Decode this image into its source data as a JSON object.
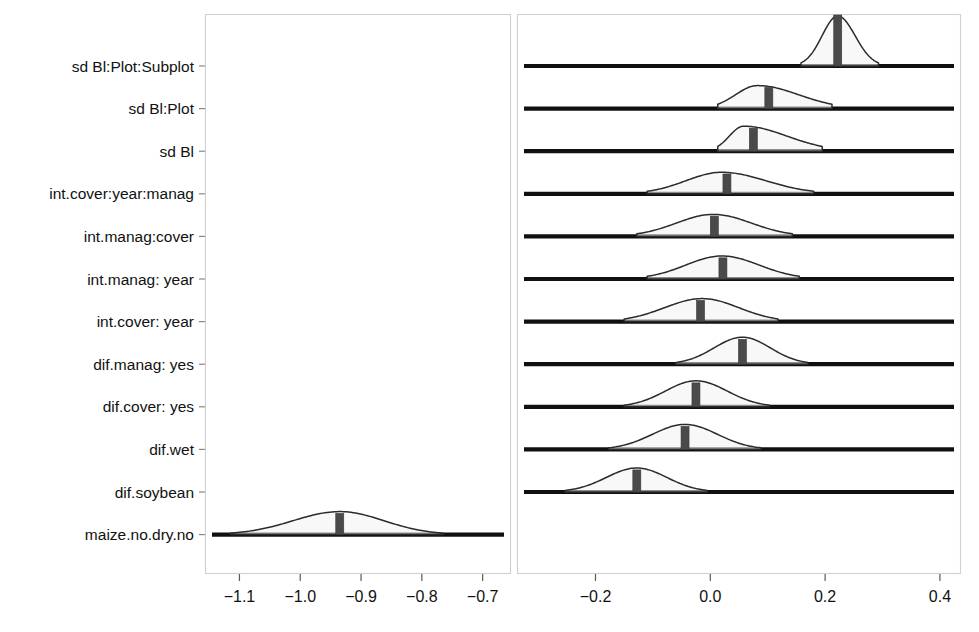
{
  "figure": {
    "name": "posterior-density-ridgeline-plot"
  },
  "chart_data": {
    "type": "area",
    "title": "",
    "xlabel": "",
    "ylabel": "",
    "grid": false,
    "legend": null,
    "orientation": "horizontal-ridgeline",
    "broken_axis": true,
    "axis_segments": [
      {
        "name": "left-panel",
        "xlim": [
          -1.155,
          -0.655
        ],
        "ticks": [
          -1.1,
          -1.0,
          -0.9,
          -0.8,
          -0.7
        ],
        "tick_labels": [
          "−1.1",
          "−1.0",
          "−0.9",
          "−0.8",
          "−0.7"
        ]
      },
      {
        "name": "right-panel",
        "xlim": [
          -0.335,
          0.435
        ],
        "ticks": [
          -0.2,
          0.0,
          0.2,
          0.4
        ],
        "tick_labels": [
          "−0.2",
          "0.0",
          "0.2",
          "0.4"
        ]
      }
    ],
    "categories": [
      "sd Bl:Plot:Subplot",
      "sd Bl:Plot",
      "sd Bl",
      "int.cover:year:manag",
      "int.manag:cover",
      "int.manag: year",
      "int.cover: year",
      "dif.manag: yes",
      "dif.cover: yes",
      "dif.wet",
      "dif.soybean",
      "maize.no.dry.no"
    ],
    "series": [
      {
        "name": "sd Bl:Plot:Subplot",
        "panel": "right",
        "median": 0.222,
        "mode": 0.222,
        "lower": 0.158,
        "upper": 0.293,
        "peak_height": 1.0,
        "shape": "symmetric-narrow"
      },
      {
        "name": "sd Bl:Plot",
        "panel": "right",
        "median": 0.102,
        "mode": 0.082,
        "lower": 0.013,
        "upper": 0.212,
        "peak_height": 0.46,
        "shape": "right-skewed-flat"
      },
      {
        "name": "sd Bl",
        "panel": "right",
        "median": 0.075,
        "mode": 0.058,
        "lower": 0.013,
        "upper": 0.195,
        "peak_height": 0.5,
        "shape": "right-skewed-flat"
      },
      {
        "name": "int.cover:year:manag",
        "panel": "right",
        "median": 0.029,
        "mode": 0.02,
        "lower": -0.11,
        "upper": 0.18,
        "peak_height": 0.43,
        "shape": "wide-symmetric"
      },
      {
        "name": "int.manag:cover",
        "panel": "right",
        "median": 0.007,
        "mode": 0.005,
        "lower": -0.128,
        "upper": 0.143,
        "peak_height": 0.44,
        "shape": "wide-symmetric"
      },
      {
        "name": "int.manag: year",
        "panel": "right",
        "median": 0.022,
        "mode": 0.02,
        "lower": -0.11,
        "upper": 0.155,
        "peak_height": 0.46,
        "shape": "wide-symmetric"
      },
      {
        "name": "int.cover: year",
        "panel": "right",
        "median": -0.017,
        "mode": -0.014,
        "lower": -0.15,
        "upper": 0.118,
        "peak_height": 0.46,
        "shape": "wide-symmetric"
      },
      {
        "name": "dif.manag: yes",
        "panel": "right",
        "median": 0.056,
        "mode": 0.056,
        "lower": -0.06,
        "upper": 0.17,
        "peak_height": 0.54,
        "shape": "symmetric"
      },
      {
        "name": "dif.cover: yes",
        "panel": "right",
        "median": -0.025,
        "mode": -0.025,
        "lower": -0.15,
        "upper": 0.103,
        "peak_height": 0.52,
        "shape": "symmetric"
      },
      {
        "name": "dif.wet",
        "panel": "right",
        "median": -0.044,
        "mode": -0.044,
        "lower": -0.177,
        "upper": 0.088,
        "peak_height": 0.5,
        "shape": "symmetric"
      },
      {
        "name": "dif.soybean",
        "panel": "right",
        "median": -0.128,
        "mode": -0.128,
        "lower": -0.253,
        "upper": -0.005,
        "peak_height": 0.48,
        "shape": "symmetric"
      },
      {
        "name": "maize.no.dry.no",
        "panel": "left",
        "median": -0.935,
        "mode": -0.935,
        "lower": -1.115,
        "upper": -0.765,
        "peak_height": 0.46,
        "shape": "symmetric"
      }
    ]
  },
  "axis": {
    "y_labels": [
      "sd Bl:Plot:Subplot",
      "sd Bl:Plot",
      "sd Bl",
      "int.cover:year:manag",
      "int.manag:cover",
      "int.manag: year",
      "int.cover: year",
      "dif.manag: yes",
      "dif.cover: yes",
      "dif.wet",
      "dif.soybean",
      "maize.no.dry.no"
    ],
    "x_labels_left": [
      "−1.1",
      "−1.0",
      "−0.9",
      "−0.8",
      "−0.7"
    ],
    "x_labels_right": [
      "−0.2",
      "0.0",
      "0.2",
      "0.4"
    ]
  },
  "colors": {
    "baseline": "#101010",
    "density_fill": "#f2f2f2",
    "density_stroke": "#2b2b2b",
    "median_bar": "#4a4a4a",
    "frame": "#d0d0d0",
    "text": "#111111",
    "background": "#ffffff"
  }
}
